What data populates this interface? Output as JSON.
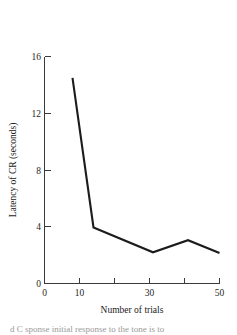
{
  "figure": {
    "background_color": "#ffffff",
    "line_color": "#1c1c1c",
    "axis_color": "#3a3a3a",
    "text_color": "#1a1a1a"
  },
  "caption": {
    "text": "d C sponse initial response to the tone is to"
  },
  "chart_data": {
    "type": "line",
    "title": "",
    "subtitle": "",
    "xlabel": "Number of trials",
    "ylabel": "Latency of CR (seconds)",
    "xlim": [
      0,
      50
    ],
    "ylim": [
      0,
      16
    ],
    "grid": false,
    "legend": null,
    "x_ticks": [
      0,
      10,
      20,
      30,
      40,
      50
    ],
    "x_tick_labels": [
      "0",
      "10",
      "",
      "30",
      "",
      "50"
    ],
    "y_ticks": [
      0,
      4,
      8,
      12,
      16
    ],
    "y_tick_labels": [
      "0",
      "4",
      "8",
      "12",
      "16"
    ],
    "series": [
      {
        "name": "Latency of CR",
        "x": [
          8,
          14,
          31,
          41,
          50
        ],
        "values": [
          14.5,
          3.95,
          2.2,
          3.05,
          2.15
        ]
      }
    ],
    "annotations": []
  }
}
